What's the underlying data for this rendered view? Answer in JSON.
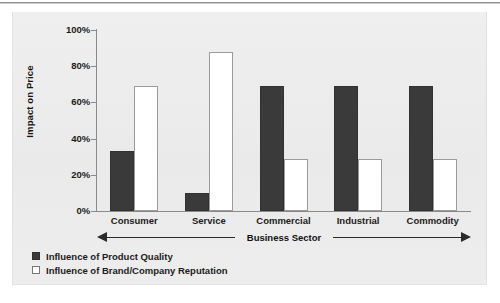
{
  "chart_data": {
    "type": "bar",
    "title": "",
    "xlabel": "Business Sector",
    "ylabel": "Impact on Price",
    "categories": [
      "Consumer",
      "Service",
      "Commercial",
      "Industrial",
      "Commodity"
    ],
    "series": [
      {
        "name": "Influence of Product Quality",
        "color": "#3a3a3a",
        "values": [
          33,
          10,
          69,
          69,
          69
        ]
      },
      {
        "name": "Influence of Brand/Company Reputation",
        "color": "#ffffff",
        "values": [
          69,
          88,
          29,
          29,
          29
        ]
      }
    ],
    "ylim": [
      0,
      100
    ],
    "yticks": [
      "0%",
      "20%",
      "40%",
      "60%",
      "80%",
      "100%"
    ],
    "ytick_values": [
      0,
      20,
      40,
      60,
      80,
      100
    ],
    "grid": false,
    "legend_position": "bottom-left",
    "axis_arrow": "double"
  },
  "axes": {
    "y_title": "Impact on Price",
    "x_title": "Business Sector"
  },
  "legend": {
    "items": [
      {
        "label": "Influence of Product Quality",
        "swatch": "dark"
      },
      {
        "label": "Influence of Brand/Company Reputation",
        "swatch": "light"
      }
    ]
  }
}
